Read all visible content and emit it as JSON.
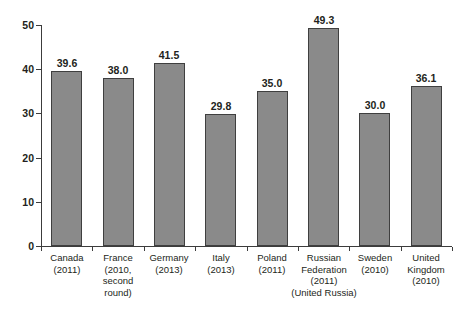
{
  "chart_data": {
    "type": "bar",
    "title": "",
    "subtitle": "",
    "xlabel": "",
    "ylabel": "",
    "ylim": [
      0,
      50
    ],
    "yticks": [
      0,
      10,
      20,
      30,
      40,
      50
    ],
    "ytick_labels": [
      "0",
      "10",
      "20",
      "30",
      "40",
      "50"
    ],
    "grid": false,
    "legend": false,
    "categories": [
      "Canada (2011)",
      "France (2010, second round)",
      "Germany (2013)",
      "Italy (2013)",
      "Poland (2011)",
      "Russian Federation (2011) (United Russia)",
      "Sweden (2010)",
      "United Kingdom (2010)"
    ],
    "category_lines": [
      [
        "Canada",
        "(2011)"
      ],
      [
        "France",
        "(2010,",
        "second",
        "round)"
      ],
      [
        "Germany",
        "(2013)"
      ],
      [
        "Italy",
        "(2013)"
      ],
      [
        "Poland",
        "(2011)"
      ],
      [
        "Russian",
        "Federation",
        "(2011)",
        "(United Russia)"
      ],
      [
        "Sweden",
        "(2010)"
      ],
      [
        "United",
        "Kingdom",
        "(2010)"
      ]
    ],
    "values": [
      39.6,
      38.0,
      41.5,
      29.8,
      35.0,
      49.3,
      30.0,
      36.1
    ],
    "value_labels": [
      "39.6",
      "38.0",
      "41.5",
      "29.8",
      "35.0",
      "49.3",
      "30.0",
      "36.1"
    ],
    "bar_color": "#8a8a8a",
    "bar_border_color": "#3f3f3f",
    "axis_color": "#3c3c3c",
    "text_color": "#231f20",
    "background": "#ffffff"
  }
}
